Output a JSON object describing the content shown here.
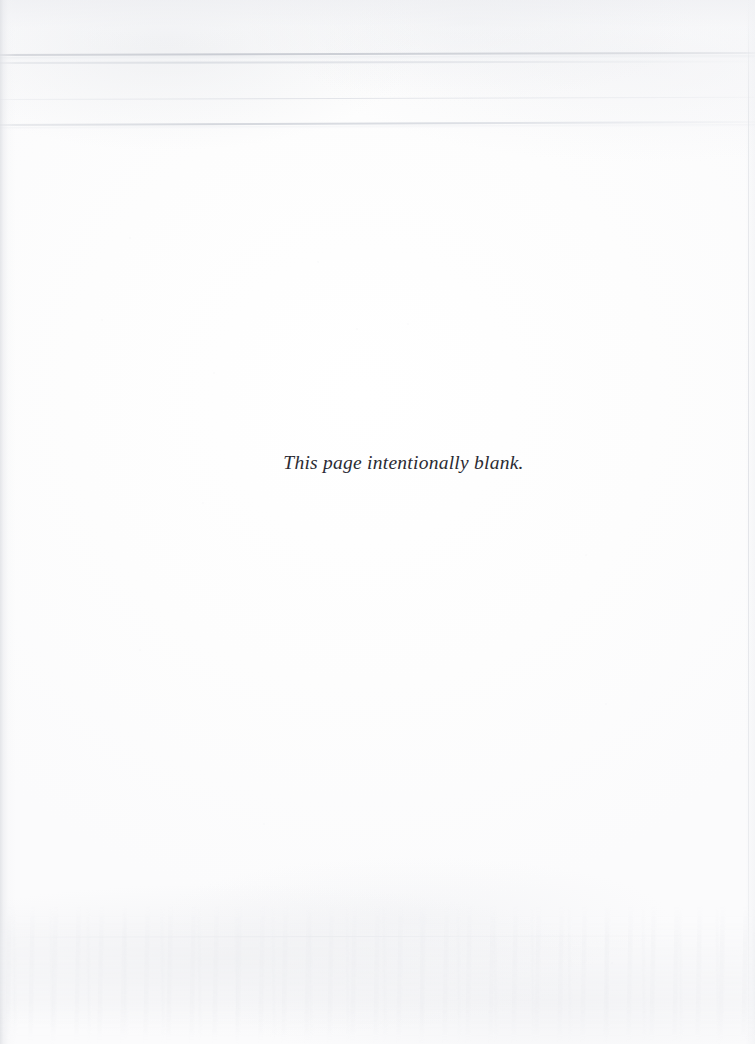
{
  "page": {
    "kind": "scanned-book-page",
    "width": 755,
    "height": 1044,
    "background_color": "#fdfdfe",
    "paper_tint": "#fbfbfc"
  },
  "notice": {
    "text": "This page intentionally blank.",
    "style": "italic-serif",
    "color": "#2b2b33",
    "align": "center"
  },
  "artifacts": {
    "scan_lines": [
      {
        "name": "scan-line-1",
        "top": 54,
        "color": "#c8cbd2"
      },
      {
        "name": "scan-line-2",
        "top": 62,
        "color": "#dadde2"
      },
      {
        "name": "scan-line-3",
        "top": 99,
        "color": "#dcdee4"
      },
      {
        "name": "scan-line-4",
        "top": 124,
        "color": "#d3d6dc"
      }
    ],
    "left_edge_shadow_color": "#dee0e4",
    "right_edge_line_color": "#dee0e5",
    "bottom_noise_color": "#e9eaee"
  }
}
